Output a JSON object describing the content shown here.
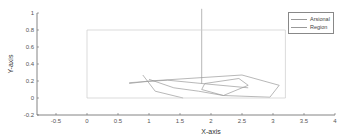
{
  "chart_data": {
    "type": "line",
    "title": "",
    "xlabel": "X-axis",
    "ylabel": "Y-axis",
    "xlim": [
      -0.8,
      4
    ],
    "ylim": [
      -0.2,
      1
    ],
    "xticks": [
      -0.5,
      0,
      0.5,
      1,
      1.5,
      2,
      2.5,
      3,
      3.5,
      4
    ],
    "xtick_labels": [
      "-0.5",
      "0",
      "0.5",
      "1",
      "1.5",
      "2",
      "2.5",
      "3",
      "3.5",
      "4"
    ],
    "yticks": [
      -0.2,
      0,
      0.2,
      0.4,
      0.6,
      0.8,
      1
    ],
    "ytick_labels": [
      "-0.2",
      "0",
      "0.2",
      "0.4",
      "0.6",
      "0.8",
      "1"
    ],
    "grid": false,
    "legend_position": "northeast",
    "series": [
      {
        "name": "Arsional",
        "color": "#999999",
        "segments": [
          {
            "x": [
              0.68,
              1.0,
              2.5,
              3.1,
              2.95,
              2.2,
              1.8,
              1.4,
              1.0
            ],
            "y": [
              0.17,
              0.2,
              0.27,
              0.15,
              0.01,
              0.03,
              0.08,
              0.12,
              0.22
            ]
          },
          {
            "x": [
              1.9,
              2.45,
              2.6,
              2.2,
              1.85,
              1.9
            ],
            "y": [
              0.17,
              0.23,
              0.15,
              0.03,
              0.1,
              0.17
            ]
          },
          {
            "x": [
              0.68,
              1.3,
              2.0,
              2.6
            ],
            "y": [
              0.18,
              0.21,
              0.16,
              0.12
            ]
          },
          {
            "x": [
              0.9,
              1.1,
              1.55
            ],
            "y": [
              0.27,
              0.08,
              0.0
            ]
          },
          {
            "x": [
              1.85,
              1.85
            ],
            "y": [
              1.05,
              0.17
            ]
          }
        ]
      },
      {
        "name": "Region",
        "color": "#cccccc",
        "x": [
          0,
          3.2,
          3.2,
          0,
          0
        ],
        "y": [
          0,
          0,
          0.8,
          0.8,
          0
        ]
      }
    ]
  },
  "legend": {
    "items": [
      {
        "label": "Arsional"
      },
      {
        "label": "Region"
      }
    ]
  }
}
